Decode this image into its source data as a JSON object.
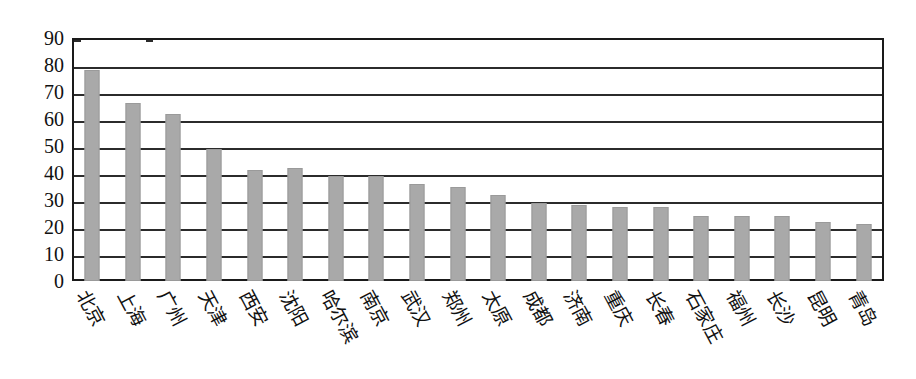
{
  "chart_data": {
    "type": "bar",
    "title": "",
    "subtitle": "",
    "xlabel": "",
    "ylabel": "",
    "ylim": [
      0,
      90
    ],
    "ytick_step": 10,
    "yticks": [
      "90",
      "80",
      "70",
      "60",
      "50",
      "40",
      "30",
      "20",
      "10",
      "0"
    ],
    "grid": true,
    "legend": false,
    "legend_position": "none",
    "bar_color": "#a9a9a9",
    "axis_color": "#2b2b2b",
    "background_color": "#ffffff",
    "categories": [
      "北京",
      "上海",
      "广州",
      "天津",
      "西安",
      "沈阳",
      "哈尔滨",
      "南京",
      "武汉",
      "郑州",
      "太原",
      "成都",
      "济南",
      "重庆",
      "长春",
      "石家庄",
      "福州",
      "长沙",
      "昆明",
      "青岛"
    ],
    "values": [
      78,
      66,
      62,
      49,
      41,
      42,
      39,
      39,
      36,
      35,
      32,
      29,
      28,
      27.5,
      27.5,
      24,
      24,
      24,
      22,
      21
    ],
    "series": [
      {
        "name": "",
        "values": [
          78,
          66,
          62,
          49,
          41,
          42,
          39,
          39,
          36,
          35,
          32,
          29,
          28,
          27.5,
          27.5,
          24,
          24,
          24,
          22,
          21
        ]
      }
    ]
  }
}
